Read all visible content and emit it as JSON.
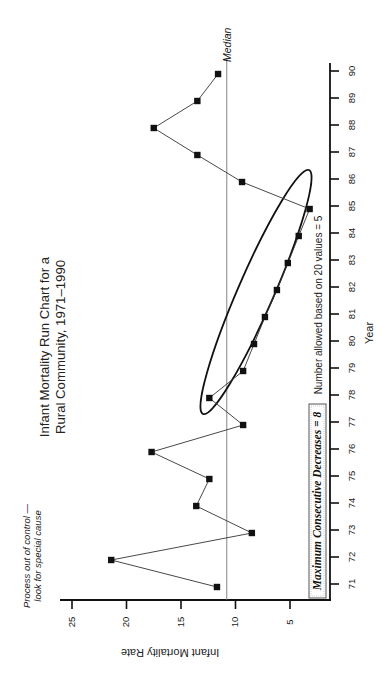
{
  "chart_data": {
    "type": "line",
    "title": "Infant Mortality Run Chart for a Rural Community, 1971–1990",
    "title_lines": [
      "Infant Mortality Run Chart for a",
      "Rural Community, 1971–1990"
    ],
    "xlabel": "Year",
    "ylabel": "Infant Mortality Rate",
    "orientation": "rotated 90 degrees clockwise",
    "categories": [
      "71",
      "72",
      "73",
      "74",
      "75",
      "76",
      "77",
      "78",
      "79",
      "80",
      "81",
      "82",
      "83",
      "84",
      "85",
      "86",
      "87",
      "88",
      "89",
      "90"
    ],
    "series": [
      {
        "name": "Infant Mortality Rate",
        "marker": "square",
        "values": [
          11.7,
          21.4,
          8.5,
          13.6,
          12.4,
          17.7,
          9.3,
          12.4,
          9.3,
          8.3,
          7.3,
          6.2,
          5.2,
          4.2,
          3.2,
          9.4,
          13.5,
          17.5,
          13.5,
          11.6
        ]
      }
    ],
    "median": 10.8,
    "median_label": "Median",
    "y_ticks": [
      5,
      10,
      15,
      20,
      25
    ],
    "y_tick_labels": [
      "5",
      "10",
      "15",
      "20",
      "25"
    ],
    "ylim": [
      1.3,
      27
    ],
    "grid": false,
    "legend": null,
    "annotations": {
      "process_note_lines": [
        "Process out of control —",
        "look for special cause"
      ],
      "boxed_text": "Maximum Consecutive Decreases = 8",
      "allowed_text": "Number allowed based on 20 values = 5",
      "highlight": "ellipse around years 78–85 (8 consecutive decreases)"
    }
  }
}
